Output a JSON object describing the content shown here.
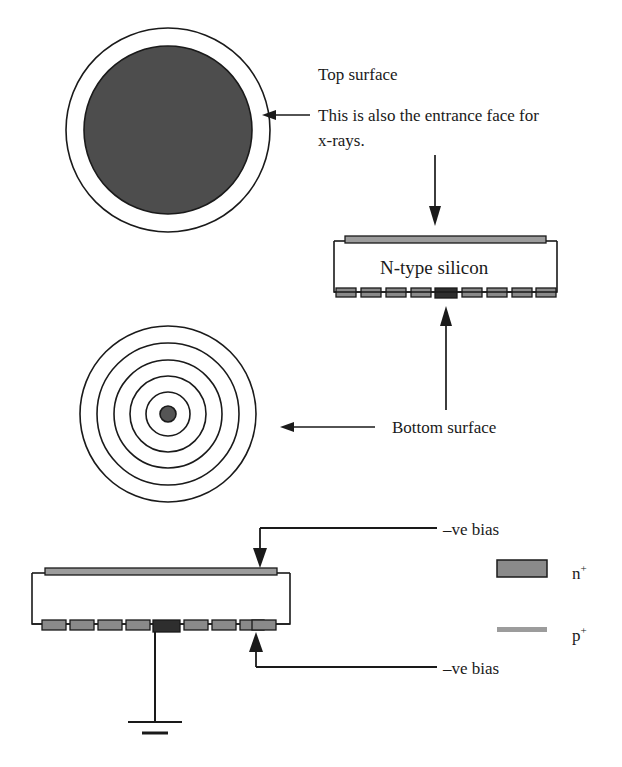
{
  "figure": {
    "background_color": "#ffffff",
    "line_color": "#1a1a1a"
  },
  "colors": {
    "n_plus_fill": "#8a8a8a",
    "n_plus_dark_fill": "#2e2e2e",
    "p_plus_fill": "#9c9c9c",
    "top_disc_fill": "#4d4d4d",
    "center_dot_fill": "#555555",
    "stroke": "#1a1a1a"
  },
  "labels": {
    "top_surface": "Top surface",
    "entrance_line_1": "This is also the entrance face for",
    "entrance_line_2": "x-rays.",
    "n_type_silicon": "N-type silicon",
    "bottom_surface": "Bottom surface",
    "bias_top": "–ve bias",
    "bias_bottom": "–ve bias"
  },
  "legend": {
    "items": [
      {
        "symbol": "n",
        "superscript": "+",
        "swatch": "filled-rectangle",
        "color": "#8a8a8a"
      },
      {
        "symbol": "p",
        "superscript": "+",
        "swatch": "thin-bar",
        "color": "#9c9c9c"
      }
    ]
  },
  "diagrams": {
    "top_view": {
      "name": "top-surface-view",
      "outer_ring_radius": 102,
      "inner_disc_radius": 84,
      "center_x": 168,
      "center_y": 130
    },
    "bottom_view": {
      "name": "bottom-surface-view",
      "center_x": 168,
      "center_y": 414,
      "ring_radii": [
        88,
        71,
        54,
        38,
        22
      ],
      "center_dot_radius": 8,
      "ring_count": 5
    },
    "cross_section_upper": {
      "name": "cross-section-upper",
      "left": 334,
      "right": 557,
      "top": 237,
      "bottom": 296,
      "contact_count": 9,
      "dark_contact_index": 4
    },
    "cross_section_lower": {
      "name": "cross-section-lower",
      "left": 32,
      "right": 290,
      "top": 569,
      "bottom": 628,
      "contact_count": 9,
      "dark_contact_index": 4,
      "ground_symbol": true
    }
  }
}
